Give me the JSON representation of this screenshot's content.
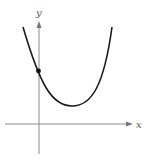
{
  "figure": {
    "type": "parabola-graph",
    "axes": {
      "x_label": "x",
      "y_label": "y",
      "axis_color": "#888888",
      "x_axis_y": 124,
      "y_axis_x": 39
    },
    "curve": {
      "shape": "upward-opening parabola",
      "color": "#1a1a1a",
      "left_top": [
        23,
        27
      ],
      "vertex": [
        72,
        106
      ],
      "right_top": [
        112,
        27
      ]
    },
    "marked_point": {
      "description": "y-intercept",
      "position": [
        38,
        71
      ],
      "color": "#111111"
    }
  }
}
